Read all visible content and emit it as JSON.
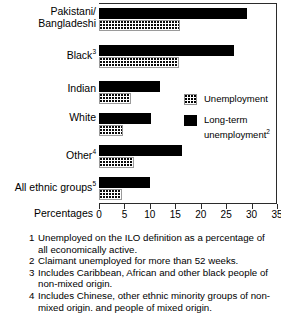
{
  "chart_data": {
    "type": "bar",
    "orientation": "horizontal",
    "title": "",
    "xlabel": "Percentages",
    "ylabel": "",
    "xlim": [
      0,
      35
    ],
    "xticks": [
      0,
      5,
      10,
      15,
      20,
      25,
      30,
      35
    ],
    "grid": false,
    "legend_position": "inside-right",
    "categories": [
      "Pakistani/ Bangladeshi",
      "Black",
      "Indian",
      "White",
      "Other",
      "All ethnic groups"
    ],
    "category_labels": [
      {
        "line1": "Pakistani/",
        "line2": "Bangladeshi",
        "sup": ""
      },
      {
        "line1": "Black",
        "line2": "",
        "sup": "3"
      },
      {
        "line1": "Indian",
        "line2": "",
        "sup": ""
      },
      {
        "line1": "White",
        "line2": "",
        "sup": ""
      },
      {
        "line1": "Other",
        "line2": "",
        "sup": "4"
      },
      {
        "line1": "All ethnic groups",
        "line2": "",
        "sup": "5"
      }
    ],
    "series": [
      {
        "name": "Long-term unemployment",
        "sup": "2",
        "color": "#000000",
        "values": [
          29.1,
          26.5,
          12.0,
          10.2,
          16.3,
          10.0
        ]
      },
      {
        "name": "Unemployment",
        "sup": "",
        "color": "#ffffff",
        "pattern": "dotted",
        "values": [
          16.0,
          15.7,
          6.3,
          4.7,
          6.9,
          4.5
        ]
      }
    ]
  },
  "axis": {
    "title": "Percentages",
    "ticks": [
      "0",
      "5",
      "10",
      "15",
      "20",
      "25",
      "30",
      "35"
    ]
  },
  "legend": {
    "items": [
      {
        "label": "Unemployment",
        "sup": "",
        "swatch": "unemp"
      },
      {
        "label_line1": "Long-term",
        "label_line2": "unemployment",
        "sup": "2",
        "swatch": "longterm"
      }
    ]
  },
  "footnotes": [
    {
      "num": "1",
      "text": "Unemployed on the ILO definition as a percentage of all economically active."
    },
    {
      "num": "2",
      "text": "Claimant unemployed for more than 52 weeks."
    },
    {
      "num": "3",
      "text": "Includes Caribbean, African and other black people of non-mixed origin."
    },
    {
      "num": "4",
      "text": "Includes Chinese, other ethnic minority groups of non-mixed origin. and people of mixed origin."
    }
  ]
}
